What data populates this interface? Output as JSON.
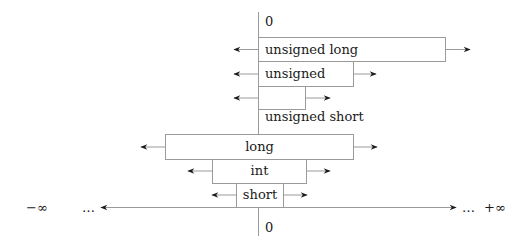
{
  "diagram": {
    "colors": {
      "line": "#9a9a9a",
      "arrow": "#1a1a1a",
      "text": "#1a1a1a",
      "background": "#ffffff"
    },
    "axis": {
      "top_zero_label": "0",
      "bottom_zero_label": "0",
      "neg_inf_label": "−∞",
      "pos_inf_label": "+∞",
      "left_ellipsis": "…",
      "right_ellipsis": "…"
    },
    "unsigned_types": [
      {
        "id": "unsigned-long",
        "label": "unsigned long"
      },
      {
        "id": "unsigned",
        "label": "unsigned"
      },
      {
        "id": "unsigned-short",
        "label": "unsigned short"
      }
    ],
    "signed_types": [
      {
        "id": "long",
        "label": "long"
      },
      {
        "id": "int",
        "label": "int"
      },
      {
        "id": "short",
        "label": "short"
      }
    ]
  }
}
